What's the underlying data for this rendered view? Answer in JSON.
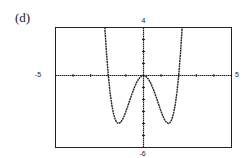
{
  "panel": {
    "label": "(d)"
  },
  "chart_data": {
    "type": "line",
    "title": "",
    "xlabel": "",
    "ylabel": "",
    "xlim": [
      -5,
      5
    ],
    "ylim": [
      -6,
      4
    ],
    "x_tick_step": 1,
    "y_tick_step": 1,
    "grid": false,
    "axis_labels": {
      "xmin": "-5",
      "xmax": "5",
      "ymax": "4",
      "ymin": "-6"
    },
    "function": "y = x^4 - 4x^2",
    "series": [
      {
        "name": "f(x)",
        "x": [
          -2.24,
          -2.2,
          -2.1,
          -2.0,
          -1.9,
          -1.8,
          -1.7,
          -1.6,
          -1.5,
          -1.414,
          -1.3,
          -1.2,
          -1.1,
          -1.0,
          -0.9,
          -0.8,
          -0.7,
          -0.6,
          -0.5,
          -0.4,
          -0.3,
          -0.2,
          -0.1,
          0.0,
          0.1,
          0.2,
          0.3,
          0.4,
          0.5,
          0.6,
          0.7,
          0.8,
          0.9,
          1.0,
          1.1,
          1.2,
          1.3,
          1.414,
          1.5,
          1.6,
          1.7,
          1.8,
          1.9,
          2.0,
          2.1,
          2.2,
          2.24
        ],
        "y": [
          5.1,
          4.07,
          1.81,
          0.0,
          -1.41,
          -2.46,
          -3.21,
          -3.69,
          -3.94,
          -4.0,
          -3.9,
          -3.69,
          -3.38,
          -3.0,
          -2.58,
          -2.15,
          -1.72,
          -1.31,
          -0.94,
          -0.61,
          -0.35,
          -0.16,
          -0.04,
          0.0,
          -0.04,
          -0.16,
          -0.35,
          -0.61,
          -0.94,
          -1.31,
          -1.72,
          -2.15,
          -2.58,
          -3.0,
          -3.38,
          -3.69,
          -3.9,
          -4.0,
          -3.94,
          -3.69,
          -3.21,
          -2.46,
          -1.41,
          0.0,
          1.81,
          4.07,
          5.1
        ]
      }
    ],
    "key_points": {
      "roots": [
        -2,
        0,
        2
      ],
      "local_max": [
        0,
        0
      ],
      "local_minima": [
        [
          -1.414,
          -4
        ],
        [
          1.414,
          -4
        ]
      ]
    }
  }
}
